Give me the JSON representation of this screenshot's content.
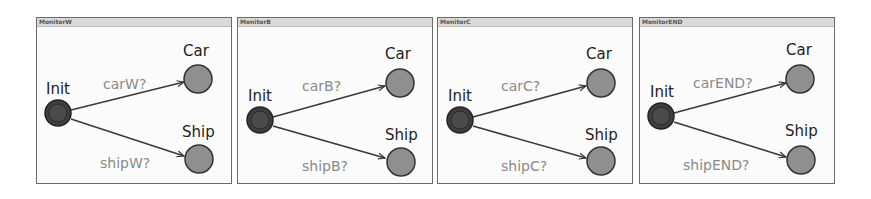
{
  "colors": {
    "panel_border": "#6b6b6b",
    "titlebar": "#d9d9d9",
    "init_fill": "#3f3f3f",
    "init_ring": "#222222",
    "state_fill": "#8f8f8f",
    "state_stroke": "#333333",
    "edge": "#3a3a3a",
    "state_label": "#222222",
    "edge_label": "#8a8a8a"
  },
  "panels": [
    {
      "title": "MonitorW",
      "init_label": "Init",
      "car_label": "Car",
      "ship_label": "Ship",
      "car_edge": "carW?",
      "ship_edge": "shipW?"
    },
    {
      "title": "MonitorB",
      "init_label": "Init",
      "car_label": "Car",
      "ship_label": "Ship",
      "car_edge": "carB?",
      "ship_edge": "shipB?"
    },
    {
      "title": "MonitorC",
      "init_label": "Init",
      "car_label": "Car",
      "ship_label": "Ship",
      "car_edge": "carC?",
      "ship_edge": "shipC?"
    },
    {
      "title": "MonitorEND",
      "init_label": "Init",
      "car_label": "Car",
      "ship_label": "Ship",
      "car_edge": "carEND?",
      "ship_edge": "shipEND?"
    }
  ]
}
